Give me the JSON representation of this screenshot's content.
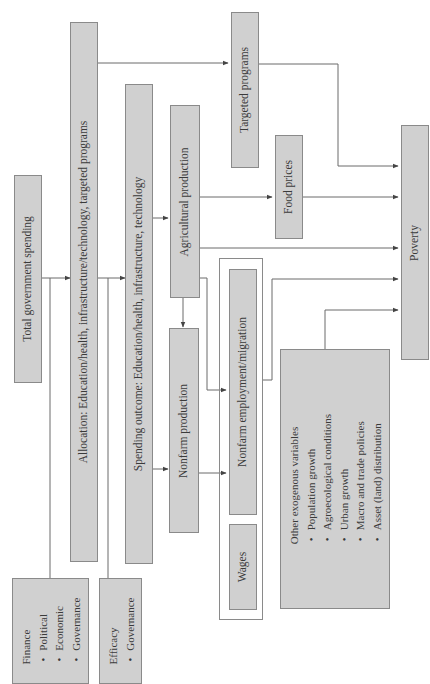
{
  "diagram": {
    "orientation": "rotated-90-counterclockwise",
    "nodes": {
      "total_spending": "Total government spending",
      "allocation": "Allocation:  Education/health, infrastructure/technology, targeted programs",
      "spending_outcome": "Spending outcome:  Education/health, infrastructure, technology",
      "agricultural_production": "Agricultural production",
      "nonfarm_production": "Nonfarm production",
      "nonfarm_employment": "Nonfarm employment/migration",
      "wages": "Wages",
      "targeted_programs": "Targeted programs",
      "food_prices": "Food prices",
      "poverty": "Poverty"
    },
    "finance": {
      "title": "Finance",
      "items": [
        "Political",
        "Economic",
        "Governance"
      ]
    },
    "efficacy": {
      "title": "Efficacy",
      "items": [
        "Governance"
      ]
    },
    "exogenous": {
      "title": "Other exogenous variables",
      "items": [
        "Population growth",
        "Agroecological conditions",
        "Urban growth",
        "Macro and trade policies",
        "Asset (land) distribution"
      ]
    },
    "edges": [
      {
        "from": "Total government spending",
        "to": "Allocation"
      },
      {
        "from": "Allocation",
        "to": "Spending outcome"
      },
      {
        "from": "Allocation",
        "to": "Targeted programs"
      },
      {
        "from": "Targeted programs",
        "to": "Poverty"
      },
      {
        "from": "Spending outcome",
        "to": "Agricultural production"
      },
      {
        "from": "Spending outcome",
        "to": "Nonfarm production"
      },
      {
        "from": "Agricultural production",
        "to": "Food prices"
      },
      {
        "from": "Agricultural production",
        "to": "Poverty"
      },
      {
        "from": "Agricultural production",
        "to": "Nonfarm production"
      },
      {
        "from": "Agricultural production",
        "to": "Nonfarm employment/migration"
      },
      {
        "from": "Nonfarm production",
        "to": "Nonfarm employment/migration"
      },
      {
        "from": "Food prices",
        "to": "Poverty"
      },
      {
        "from": "Nonfarm employment/migration + Wages",
        "to": "Poverty"
      },
      {
        "from": "Other exogenous variables",
        "to": "Poverty"
      },
      {
        "from": "Finance",
        "to": "Total government spending / Allocation"
      },
      {
        "from": "Efficacy",
        "to": "Allocation / Spending outcome"
      }
    ],
    "colors": {
      "box_fill": "#d0d0d0",
      "box_border": "#8a8a8a",
      "line": "#6a6a6a",
      "text": "#3a3a3a"
    }
  }
}
